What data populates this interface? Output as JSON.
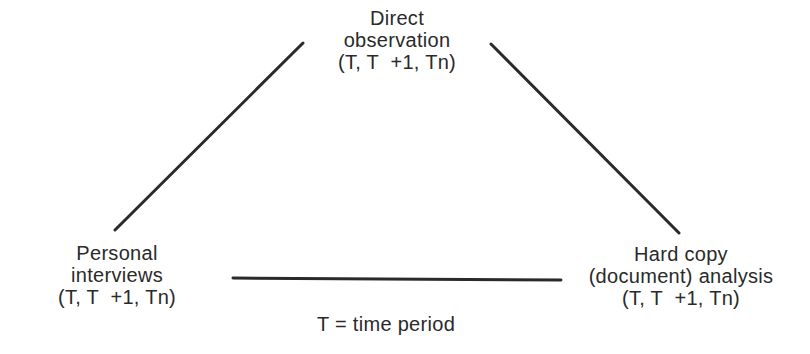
{
  "diagram": {
    "type": "triangulation",
    "colors": {
      "line": "#2a2a2a",
      "text": "#2a2a2a",
      "background": "#ffffff"
    },
    "nodes": [
      {
        "id": "top",
        "lines": [
          "Direct",
          "observation",
          "(T, T  +1, Tn)"
        ]
      },
      {
        "id": "left",
        "lines": [
          "Personal",
          "interviews",
          "(T, T  +1, Tn)"
        ]
      },
      {
        "id": "right",
        "lines": [
          "Hard copy",
          "(document) analysis",
          "(T, T  +1, Tn)"
        ]
      }
    ],
    "edges": [
      {
        "from": "left",
        "to": "top"
      },
      {
        "from": "top",
        "to": "right"
      },
      {
        "from": "left",
        "to": "right"
      }
    ],
    "legend": "T = time period"
  }
}
